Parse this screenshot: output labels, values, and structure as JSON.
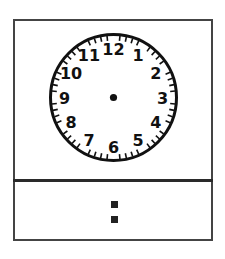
{
  "worksheet": {
    "clock": {
      "numerals": [
        "12",
        "1",
        "2",
        "3",
        "4",
        "5",
        "6",
        "7",
        "8",
        "9",
        "10",
        "11"
      ],
      "minute_ticks": 60,
      "hands_shown": false
    },
    "digital_time": {
      "hours": "",
      "separator": ":",
      "minutes": ""
    }
  }
}
